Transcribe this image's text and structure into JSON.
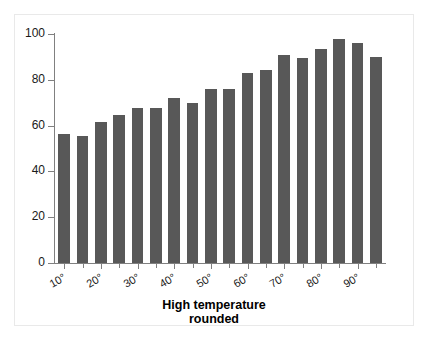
{
  "chart_data": {
    "type": "bar",
    "title": "",
    "subtitle": "",
    "xlabel_line1": "High temperature",
    "xlabel_line2": "rounded",
    "ylabel": "",
    "ylim": [
      0,
      100
    ],
    "xlim": [
      5,
      95
    ],
    "grid": false,
    "legend": null,
    "bar_color": "#585858",
    "axis_color": "#808080",
    "y_ticks": [
      0,
      20,
      40,
      60,
      80,
      100
    ],
    "y_tick_labels": [
      "0",
      "20",
      "40",
      "60",
      "80",
      "100"
    ],
    "x_ticks": [
      10,
      20,
      30,
      40,
      50,
      60,
      70,
      80,
      90
    ],
    "x_tick_labels": [
      "10°",
      "20°",
      "30°",
      "40°",
      "50°",
      "60°",
      "70°",
      "80°",
      "90°"
    ],
    "x": [
      10,
      15,
      20,
      25,
      30,
      35,
      40,
      45,
      50,
      55,
      60,
      65,
      70,
      75,
      80,
      85,
      90,
      95
    ],
    "categories": [
      "10",
      "15",
      "20",
      "25",
      "30",
      "35",
      "40",
      "45",
      "50",
      "55",
      "60",
      "65",
      "70",
      "75",
      "80",
      "85",
      "90",
      "95"
    ],
    "values": [
      56.5,
      55.5,
      61.5,
      64.5,
      67.5,
      67.5,
      72,
      70,
      76,
      76,
      83,
      84.5,
      91,
      89.5,
      93.5,
      98,
      96,
      90
    ]
  }
}
